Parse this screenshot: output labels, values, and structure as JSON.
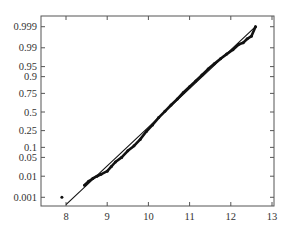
{
  "chart_data": {
    "type": "scatter",
    "title": "",
    "xlabel": "",
    "ylabel": "",
    "y_scale": "normal-probability",
    "xlim": [
      7.4,
      13.05
    ],
    "ylim": [
      0.0005,
      0.9995
    ],
    "grid": false,
    "legend": null,
    "x_ticks": [
      8,
      9,
      10,
      11,
      12,
      13
    ],
    "x_tick_labels": [
      "8",
      "9",
      "10",
      "11",
      "12",
      "13"
    ],
    "y_ticks": [
      0.001,
      0.01,
      0.05,
      0.1,
      0.25,
      0.5,
      0.75,
      0.9,
      0.95,
      0.99,
      0.999
    ],
    "y_tick_labels": [
      "0.001",
      "0.01",
      "0.05",
      "0.1",
      "0.25",
      "0.5",
      "0.75",
      "0.9",
      "0.95",
      "0.99",
      "0.999"
    ],
    "series": [
      {
        "name": "sample",
        "kind": "points",
        "x": [
          7.9,
          8.45,
          8.55,
          8.65,
          8.75,
          8.85,
          9.0,
          9.1,
          9.2,
          9.35,
          9.5,
          9.65,
          9.8,
          9.95,
          10.1,
          10.25,
          10.4,
          10.55,
          10.7,
          10.85,
          11.0,
          11.15,
          11.3,
          11.45,
          11.6,
          11.75,
          11.9,
          12.05,
          12.2,
          12.3,
          12.4,
          12.5,
          12.6
        ],
        "y": [
          0.001,
          0.004,
          0.006,
          0.008,
          0.01,
          0.012,
          0.016,
          0.024,
          0.035,
          0.05,
          0.08,
          0.11,
          0.16,
          0.24,
          0.32,
          0.42,
          0.51,
          0.6,
          0.68,
          0.76,
          0.82,
          0.87,
          0.91,
          0.94,
          0.96,
          0.973,
          0.982,
          0.988,
          0.993,
          0.994,
          0.996,
          0.997,
          0.999
        ]
      },
      {
        "name": "reference line",
        "kind": "line",
        "x": [
          8.0,
          12.6
        ],
        "y": [
          0.0004,
          0.999
        ]
      }
    ]
  },
  "colors": {
    "axis": "#555555",
    "data": "#111111",
    "text": "#333333",
    "background": "#ffffff"
  }
}
